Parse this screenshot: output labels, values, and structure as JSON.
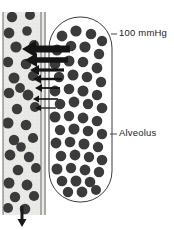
{
  "figure": {
    "width": 174,
    "height": 230,
    "background_color": "#ffffff"
  },
  "labels": {
    "pressure": {
      "text": "100 mmHg",
      "x": 119,
      "y": 33,
      "leader_x1": 111,
      "leader_x2": 117,
      "leader_y": 34
    },
    "alveolus": {
      "text": "Alveolus",
      "x": 119,
      "y": 133,
      "leader_x1": 110,
      "leader_x2": 117,
      "leader_y": 134
    }
  },
  "capillary": {
    "name": "pulmonary-capillary",
    "x": 3,
    "y": 12,
    "width": 43,
    "height": 203,
    "fill_color": "#ededea",
    "stipple_color": "#b9b9b4",
    "wall_color": "#6a6a6a",
    "wall_width": 1,
    "inner_wall_x": 41,
    "outer_wall_x": 45,
    "flow_arrow": {
      "name": "blood-flow-arrow",
      "x": 22,
      "y_start": 206,
      "y_end": 227,
      "direction": "down",
      "color": "#1a1a1a",
      "shaft_width": 3,
      "head_width": 9,
      "head_length": 8
    },
    "cells": [
      {
        "cx": 12,
        "cy": 17,
        "r": 5.2
      },
      {
        "cx": 30,
        "cy": 15,
        "r": 5.0
      },
      {
        "cx": 9,
        "cy": 33,
        "r": 5.4
      },
      {
        "cx": 27,
        "cy": 31,
        "r": 4.8
      },
      {
        "cx": 16,
        "cy": 47,
        "r": 5.6
      },
      {
        "cx": 34,
        "cy": 45,
        "r": 5.0
      },
      {
        "cx": 8,
        "cy": 62,
        "r": 5.2
      },
      {
        "cx": 26,
        "cy": 64,
        "r": 5.3
      },
      {
        "cx": 14,
        "cy": 78,
        "r": 5.5
      },
      {
        "cx": 33,
        "cy": 76,
        "r": 5.1
      },
      {
        "cx": 9,
        "cy": 93,
        "r": 5.3
      },
      {
        "cx": 28,
        "cy": 95,
        "r": 5.4
      },
      {
        "cx": 17,
        "cy": 109,
        "r": 5.2
      },
      {
        "cx": 35,
        "cy": 107,
        "r": 5.0
      },
      {
        "cx": 8,
        "cy": 123,
        "r": 5.5
      },
      {
        "cx": 26,
        "cy": 125,
        "r": 5.3
      },
      {
        "cx": 14,
        "cy": 140,
        "r": 5.2
      },
      {
        "cx": 33,
        "cy": 138,
        "r": 5.1
      },
      {
        "cx": 10,
        "cy": 155,
        "r": 5.4
      },
      {
        "cx": 29,
        "cy": 157,
        "r": 5.2
      },
      {
        "cx": 18,
        "cy": 170,
        "r": 5.3
      },
      {
        "cx": 36,
        "cy": 168,
        "r": 5.0
      },
      {
        "cx": 9,
        "cy": 183,
        "r": 5.5
      },
      {
        "cx": 27,
        "cy": 185,
        "r": 5.4
      },
      {
        "cx": 15,
        "cy": 197,
        "r": 5.2
      },
      {
        "cx": 34,
        "cy": 196,
        "r": 5.1
      },
      {
        "cx": 8,
        "cy": 208,
        "r": 5.0
      },
      {
        "cx": 25,
        "cy": 209,
        "r": 5.3
      },
      {
        "cx": 20,
        "cy": 88,
        "r": 4.9
      },
      {
        "cx": 21,
        "cy": 147,
        "r": 4.8
      }
    ],
    "cell_color": "#3b3b3b"
  },
  "alveolus": {
    "name": "alveolus-sac",
    "x": 49,
    "y": 17,
    "width": 63,
    "height": 185,
    "corner_radius": 31,
    "fill_color": "#ffffff",
    "outline_color": "#3d3d3d",
    "outline_width": 1,
    "molecule_color": "#3b3b3b",
    "molecules": [
      {
        "cx": 62,
        "cy": 36,
        "r": 5.4
      },
      {
        "cx": 76,
        "cy": 31,
        "r": 5.6
      },
      {
        "cx": 91,
        "cy": 34,
        "r": 5.3
      },
      {
        "cx": 102,
        "cy": 41,
        "r": 5.2
      },
      {
        "cx": 57,
        "cy": 50,
        "r": 5.5
      },
      {
        "cx": 71,
        "cy": 46,
        "r": 5.3
      },
      {
        "cx": 85,
        "cy": 47,
        "r": 5.6
      },
      {
        "cx": 99,
        "cy": 54,
        "r": 5.2
      },
      {
        "cx": 55,
        "cy": 64,
        "r": 5.4
      },
      {
        "cx": 69,
        "cy": 61,
        "r": 5.5
      },
      {
        "cx": 83,
        "cy": 62,
        "r": 5.3
      },
      {
        "cx": 97,
        "cy": 68,
        "r": 5.4
      },
      {
        "cx": 59,
        "cy": 77,
        "r": 5.2
      },
      {
        "cx": 73,
        "cy": 75,
        "r": 5.5
      },
      {
        "cx": 87,
        "cy": 77,
        "r": 5.3
      },
      {
        "cx": 101,
        "cy": 82,
        "r": 5.2
      },
      {
        "cx": 55,
        "cy": 91,
        "r": 5.4
      },
      {
        "cx": 69,
        "cy": 89,
        "r": 5.3
      },
      {
        "cx": 83,
        "cy": 91,
        "r": 5.5
      },
      {
        "cx": 97,
        "cy": 95,
        "r": 5.2
      },
      {
        "cx": 60,
        "cy": 104,
        "r": 5.3
      },
      {
        "cx": 74,
        "cy": 102,
        "r": 5.4
      },
      {
        "cx": 88,
        "cy": 104,
        "r": 5.2
      },
      {
        "cx": 102,
        "cy": 108,
        "r": 5.3
      },
      {
        "cx": 55,
        "cy": 117,
        "r": 5.5
      },
      {
        "cx": 69,
        "cy": 116,
        "r": 5.2
      },
      {
        "cx": 83,
        "cy": 118,
        "r": 5.4
      },
      {
        "cx": 97,
        "cy": 121,
        "r": 5.3
      },
      {
        "cx": 60,
        "cy": 130,
        "r": 5.2
      },
      {
        "cx": 74,
        "cy": 129,
        "r": 5.5
      },
      {
        "cx": 88,
        "cy": 131,
        "r": 5.3
      },
      {
        "cx": 102,
        "cy": 134,
        "r": 5.2
      },
      {
        "cx": 56,
        "cy": 143,
        "r": 5.4
      },
      {
        "cx": 70,
        "cy": 142,
        "r": 5.3
      },
      {
        "cx": 84,
        "cy": 144,
        "r": 5.5
      },
      {
        "cx": 98,
        "cy": 147,
        "r": 5.2
      },
      {
        "cx": 61,
        "cy": 156,
        "r": 5.3
      },
      {
        "cx": 75,
        "cy": 155,
        "r": 5.4
      },
      {
        "cx": 89,
        "cy": 157,
        "r": 5.2
      },
      {
        "cx": 102,
        "cy": 160,
        "r": 5.3
      },
      {
        "cx": 57,
        "cy": 169,
        "r": 5.5
      },
      {
        "cx": 71,
        "cy": 168,
        "r": 5.2
      },
      {
        "cx": 85,
        "cy": 170,
        "r": 5.4
      },
      {
        "cx": 99,
        "cy": 172,
        "r": 5.2
      },
      {
        "cx": 62,
        "cy": 181,
        "r": 5.3
      },
      {
        "cx": 76,
        "cy": 181,
        "r": 5.5
      },
      {
        "cx": 90,
        "cy": 182,
        "r": 5.3
      },
      {
        "cx": 68,
        "cy": 192,
        "r": 5.2
      },
      {
        "cx": 82,
        "cy": 192,
        "r": 5.4
      },
      {
        "cx": 96,
        "cy": 190,
        "r": 5.0
      }
    ]
  },
  "diffusion_arrows": {
    "name": "oxygen-diffusion-arrows",
    "color": "#141414",
    "direction": "right-to-left",
    "description": "Oxygen diffusing from alveolus into capillary, thickness decreasing downward",
    "items": [
      {
        "index": 1,
        "tip_x": 22,
        "tail_x": 70,
        "y": 49,
        "shaft_height": 7.0,
        "head_width": 14,
        "head_height": 17
      },
      {
        "index": 2,
        "tip_x": 25,
        "tail_x": 68,
        "y": 60,
        "shaft_height": 5.5,
        "head_width": 12,
        "head_height": 14
      },
      {
        "index": 3,
        "tip_x": 30,
        "tail_x": 64,
        "y": 70,
        "shaft_height": 3.2,
        "head_width": 9,
        "head_height": 10
      },
      {
        "index": 4,
        "tip_x": 33,
        "tail_x": 62,
        "y": 79,
        "shaft_height": 2.4,
        "head_width": 8,
        "head_height": 9
      },
      {
        "index": 5,
        "tip_x": 35,
        "tail_x": 60,
        "y": 88,
        "shaft_height": 1.8,
        "head_width": 7,
        "head_height": 8
      },
      {
        "index": 6,
        "tip_x": 33,
        "tail_x": 58,
        "y": 99,
        "shaft_height": 1.6,
        "head_width": 6,
        "head_height": 7
      },
      {
        "index": 7,
        "tip_x": 35,
        "tail_x": 56,
        "y": 108,
        "shaft_height": 1.3,
        "head_width": 6,
        "head_height": 6
      }
    ]
  }
}
